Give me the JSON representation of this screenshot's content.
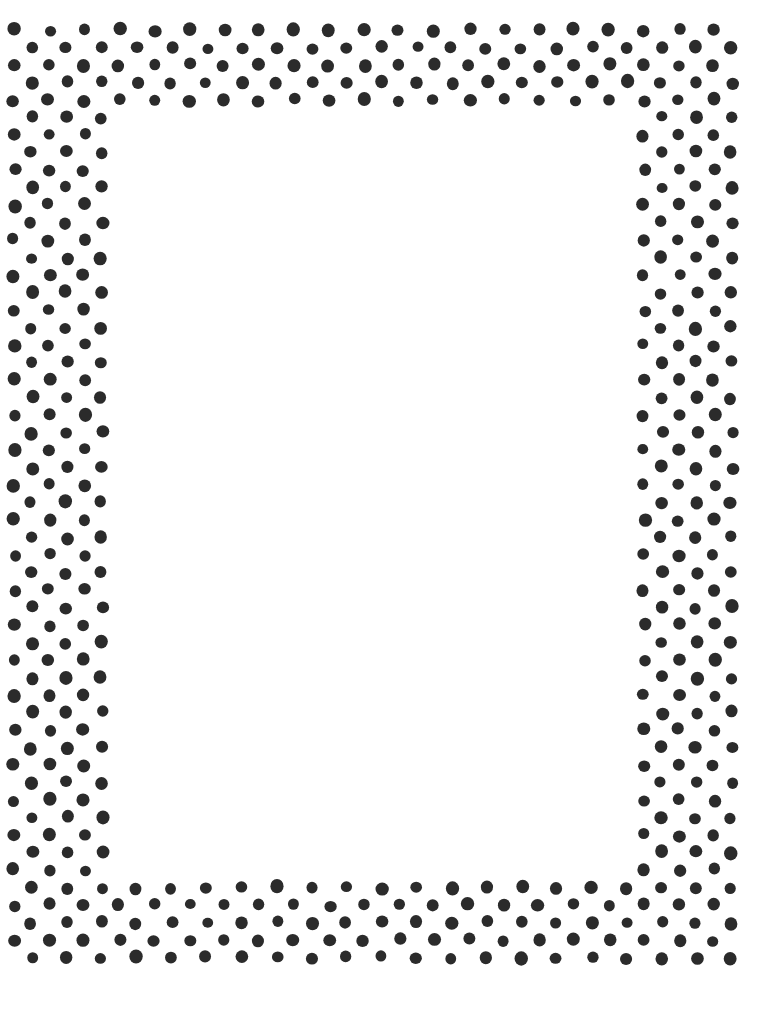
{
  "page": {
    "width": 778,
    "height": 1014,
    "background_color": "#ffffff"
  },
  "artwork": {
    "name": "polka-dot-border",
    "style": "staggered-offset-grid",
    "dot_color": "#2b2b2b",
    "dot_diameter": 12,
    "dot_radius": 6,
    "horizontal_pitch": 35,
    "vertical_pitch": 17.5,
    "row_offset": 17.5,
    "jitter": 1.6,
    "shape": "circle",
    "rotation_variance_deg": 8
  },
  "frame": {
    "outer": {
      "left": 14,
      "top": 30,
      "right": 732,
      "bottom": 958
    },
    "bands": {
      "top": {
        "left": 14,
        "top": 30,
        "width": 718,
        "height": 92
      },
      "bottom": {
        "left": 14,
        "top": 866,
        "width": 718,
        "height": 92
      },
      "left": {
        "left": 14,
        "top": 30,
        "width": 92,
        "height": 928
      },
      "right": {
        "left": 640,
        "top": 30,
        "width": 92,
        "height": 928
      }
    },
    "band_thickness": 92
  },
  "inner_area": {
    "name": "blank-content-area",
    "left": 112,
    "top": 122,
    "width": 522,
    "height": 744,
    "background_color": "#ffffff",
    "content": ""
  },
  "dot_rows": {
    "top_band_row_count": 6,
    "bottom_band_row_count": 6,
    "left_band_column_count": 3,
    "right_band_column_count": 3,
    "first_row_y": 38,
    "last_row_y": 948,
    "first_column_x": 28,
    "last_column_x": 722
  }
}
